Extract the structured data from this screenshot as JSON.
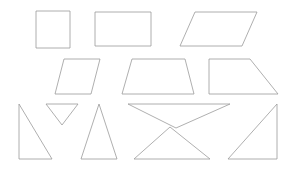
{
  "figure": {
    "canvas_width": 295,
    "canvas_height": 169,
    "background_color": "#ffffff",
    "stroke_color": "#9a9a9a",
    "fill": "none",
    "stroke_width": 0.8,
    "row_count": 3,
    "shape_count": 11
  },
  "chart_data": {
    "type": "diagram",
    "xlabel": "",
    "ylabel": "",
    "xlim": [
      0,
      295
    ],
    "ylim": [
      0,
      169
    ],
    "grid": false,
    "legend": "none",
    "background_color": "#ffffff",
    "stroke_color": "#9a9a9a",
    "rows": [
      {
        "row_index": 1,
        "label": "Row 1 - quadrilaterals",
        "shape_names": [
          "square",
          "rectangle",
          "parallelogram"
        ]
      },
      {
        "row_index": 2,
        "label": "Row 2 - quadrilaterals",
        "shape_names": [
          "parallelogram-slanted",
          "trapezoid-isosceles",
          "trapezoid-right"
        ]
      },
      {
        "row_index": 3,
        "label": "Row 3 - triangles",
        "shape_names": [
          "right-triangle-left",
          "inverted-triangle-small",
          "isosceles-triangle",
          "inverted-triangle-wide",
          "upright-triangle-wide",
          "right-triangle-right"
        ]
      }
    ],
    "shapes": [
      {
        "id": "square",
        "name": "square",
        "row": 1,
        "sides": 4,
        "points": [
          [
            36,
            11
          ],
          [
            70,
            11
          ],
          [
            70,
            48
          ],
          [
            36,
            48
          ]
        ]
      },
      {
        "id": "rectangle",
        "name": "rectangle",
        "row": 1,
        "sides": 4,
        "points": [
          [
            95,
            12
          ],
          [
            151,
            12
          ],
          [
            151,
            46
          ],
          [
            95,
            46
          ]
        ]
      },
      {
        "id": "parallelogram",
        "name": "parallelogram",
        "row": 1,
        "sides": 4,
        "points": [
          [
            195,
            12
          ],
          [
            257,
            12
          ],
          [
            242,
            46
          ],
          [
            180,
            46
          ]
        ]
      },
      {
        "id": "parallelogram-slanted",
        "name": "parallelogram-slanted",
        "row": 2,
        "sides": 4,
        "points": [
          [
            64,
            59
          ],
          [
            100,
            59
          ],
          [
            91,
            94
          ],
          [
            55,
            94
          ]
        ]
      },
      {
        "id": "trapezoid-isosceles",
        "name": "trapezoid-isosceles",
        "row": 2,
        "sides": 4,
        "points": [
          [
            132,
            59
          ],
          [
            185,
            59
          ],
          [
            194,
            94
          ],
          [
            122,
            94
          ]
        ]
      },
      {
        "id": "trapezoid-right",
        "name": "trapezoid-right",
        "row": 2,
        "sides": 4,
        "points": [
          [
            209,
            59
          ],
          [
            250,
            59
          ],
          [
            278,
            94
          ],
          [
            209,
            94
          ]
        ]
      },
      {
        "id": "right-triangle-left",
        "name": "right-triangle-left",
        "row": 3,
        "sides": 3,
        "points": [
          [
            19,
            104
          ],
          [
            52,
            159
          ],
          [
            19,
            159
          ]
        ]
      },
      {
        "id": "inverted-triangle-small",
        "name": "inverted-triangle-small",
        "row": 3,
        "sides": 3,
        "points": [
          [
            46,
            104
          ],
          [
            78,
            104
          ],
          [
            62,
            125
          ]
        ]
      },
      {
        "id": "isosceles-triangle",
        "name": "isosceles-triangle",
        "row": 3,
        "sides": 3,
        "points": [
          [
            99,
            104
          ],
          [
            117,
            159
          ],
          [
            81,
            159
          ]
        ]
      },
      {
        "id": "inverted-triangle-wide",
        "name": "inverted-triangle-wide",
        "row": 3,
        "sides": 3,
        "points": [
          [
            128,
            104
          ],
          [
            230,
            104
          ],
          [
            176,
            128
          ]
        ]
      },
      {
        "id": "upright-triangle-wide",
        "name": "upright-triangle-wide",
        "row": 3,
        "sides": 3,
        "points": [
          [
            170,
            127
          ],
          [
            210,
            159
          ],
          [
            134,
            159
          ]
        ]
      },
      {
        "id": "right-triangle-right",
        "name": "right-triangle-right",
        "row": 3,
        "sides": 3,
        "points": [
          [
            277,
            104
          ],
          [
            277,
            159
          ],
          [
            228,
            159
          ]
        ]
      }
    ]
  }
}
